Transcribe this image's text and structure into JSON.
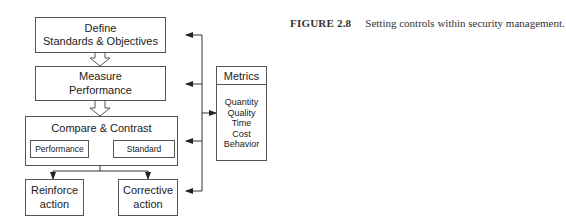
{
  "diagram": {
    "steps": [
      {
        "id": "define",
        "lines": [
          "Define",
          "Standards & Objectives"
        ]
      },
      {
        "id": "measure",
        "lines": [
          "Measure",
          "Performance"
        ]
      },
      {
        "id": "compare",
        "title": "Compare & Contrast",
        "left": "Performance",
        "right": "Standard"
      }
    ],
    "outcomes": [
      {
        "id": "reinforce",
        "lines": [
          "Reinforce",
          "action"
        ]
      },
      {
        "id": "corrective",
        "lines": [
          "Corrective",
          "action"
        ]
      }
    ],
    "metrics": {
      "title": "Metrics",
      "items": [
        "Quantity",
        "Quality",
        "Time",
        "Cost",
        "Behavior"
      ]
    }
  },
  "caption": {
    "label": "FIGURE 2.8",
    "text": "Setting controls within security management."
  },
  "colors": {
    "line": "#333333",
    "box_border": "#555555",
    "background": "#ffffff"
  }
}
